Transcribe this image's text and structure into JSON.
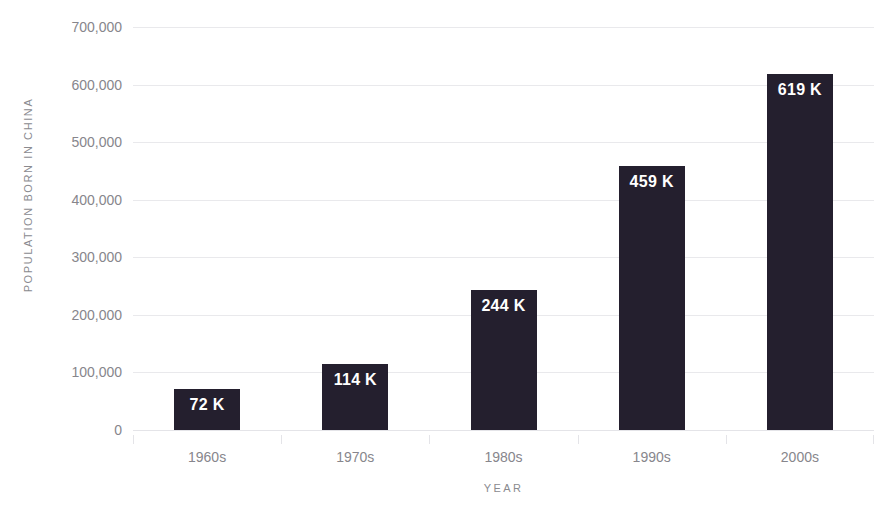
{
  "chart_data": {
    "type": "bar",
    "title": "",
    "subtitle": "",
    "xlabel": "YEAR",
    "ylabel": "POPULATION BORN IN CHINA",
    "categories": [
      "1960s",
      "1970s",
      "1980s",
      "1990s",
      "2000s"
    ],
    "values": [
      72000,
      114000,
      244000,
      459000,
      619000
    ],
    "value_labels": [
      "72 K",
      "114 K",
      "244 K",
      "459 K",
      "619 K"
    ],
    "ylim": [
      0,
      700000
    ],
    "ytick_labels": [
      "700,000",
      "600,000",
      "500,000",
      "400,000",
      "300,000",
      "200,000",
      "100,000",
      "0"
    ],
    "ytick_values": [
      700000,
      600000,
      500000,
      400000,
      300000,
      200000,
      100000,
      0
    ],
    "grid": true,
    "legend": false,
    "legend_position": "none",
    "bar_color": "#241f2e",
    "value_label_color": "#ffffff",
    "axis_text_color": "#87868c",
    "gridline_color": "#e9e9ec",
    "background_color": "#ffffff"
  }
}
